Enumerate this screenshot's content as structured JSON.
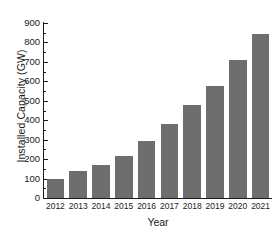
{
  "chart_data": {
    "type": "bar",
    "title": "",
    "subtitle": "",
    "xlabel": "Year",
    "ylabel": "Installed Capacity (GW)",
    "categories": [
      "2012",
      "2013",
      "2014",
      "2015",
      "2016",
      "2017",
      "2018",
      "2019",
      "2020",
      "2021"
    ],
    "values": [
      100,
      137,
      172,
      218,
      292,
      383,
      480,
      577,
      710,
      843
    ],
    "series": [
      {
        "name": "Installed Capacity",
        "values": [
          100,
          137,
          172,
          218,
          292,
          383,
          480,
          577,
          710,
          843
        ]
      }
    ],
    "ylim": [
      0,
      900
    ],
    "y_major_ticks": [
      0,
      100,
      200,
      300,
      400,
      500,
      600,
      700,
      800,
      900
    ],
    "y_minor_ticks": [
      50,
      150,
      250,
      350,
      450,
      550,
      650,
      750,
      850
    ],
    "y_tick_labels": [
      "0",
      "100",
      "200",
      "300",
      "400",
      "500",
      "600",
      "700",
      "800",
      "900"
    ],
    "x_tick_labels": [
      "2012",
      "2013",
      "2014",
      "2015",
      "2016",
      "2017",
      "2018",
      "2019",
      "2020",
      "2021"
    ],
    "grid": false,
    "legend": false,
    "legend_position": "none",
    "bar_color": "#6e6e6e",
    "axis_color": "#1a1a1a",
    "background_color": "#ffffff",
    "spines": [
      "left",
      "bottom"
    ],
    "tick_direction": "in",
    "annotations": []
  }
}
